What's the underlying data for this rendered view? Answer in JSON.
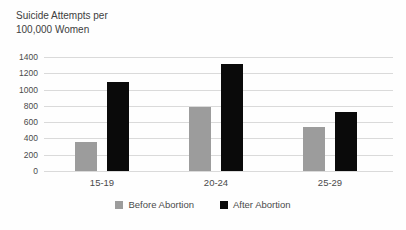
{
  "chart_data": {
    "type": "bar",
    "title": "Suicide Attempts per 100,000 Women",
    "title_lines": [
      "Suicide Attempts per",
      "100,000 Women"
    ],
    "categories": [
      "15-19",
      "20-24",
      "25-29"
    ],
    "series": [
      {
        "name": "Before Abortion",
        "color": "#9c9c9c",
        "values": [
          360,
          790,
          540
        ]
      },
      {
        "name": "After Abortion",
        "color": "#0a0a0a",
        "values": [
          1090,
          1320,
          730
        ]
      }
    ],
    "xlabel": "",
    "ylabel": "",
    "ylim": [
      0,
      1400
    ],
    "yticks": [
      0,
      200,
      400,
      600,
      800,
      1000,
      1200,
      1400
    ],
    "grid": true,
    "gridline_color": "#dadada",
    "text_color": "#4a4a4a",
    "legend_position": "bottom"
  }
}
